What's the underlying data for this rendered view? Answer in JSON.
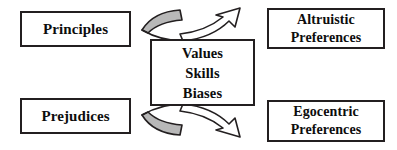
{
  "diagram": {
    "colors": {
      "box_border": "#231f20",
      "box_fill": "#ffffff",
      "text": "#0d0d0d",
      "wing_fill_gray": "#b8b8b8",
      "arrow_fill_white": "#ffffff",
      "stroke": "#231f20",
      "background": "#ffffff"
    },
    "nodes": {
      "principles": {
        "id": "principles",
        "role": "input-top-left",
        "lines": [
          "Principles"
        ]
      },
      "prejudices": {
        "id": "prejudices",
        "role": "input-bottom-left",
        "lines": [
          "Prejudices"
        ]
      },
      "core": {
        "id": "core",
        "role": "mediator-center",
        "lines": [
          "Values",
          "Skills",
          "Biases"
        ]
      },
      "altruistic": {
        "id": "altruistic",
        "role": "output-top-right",
        "lines": [
          "Altruistic",
          "Preferences"
        ]
      },
      "egocentric": {
        "id": "egocentric",
        "role": "output-bottom-right",
        "lines": [
          "Egocentric",
          "Preferences"
        ]
      }
    },
    "connectors": [
      {
        "id": "connector-top",
        "shape": "bowtie-wing-arrow",
        "from": "principles",
        "to": "altruistic",
        "left_wing_fill": "#b8b8b8",
        "right_arrow_fill": "#ffffff",
        "direction": "up-right"
      },
      {
        "id": "connector-bottom",
        "shape": "bowtie-wing-arrow",
        "from": "prejudices",
        "to": "egocentric",
        "left_wing_fill": "#b8b8b8",
        "right_arrow_fill": "#ffffff",
        "direction": "down-right"
      }
    ]
  }
}
